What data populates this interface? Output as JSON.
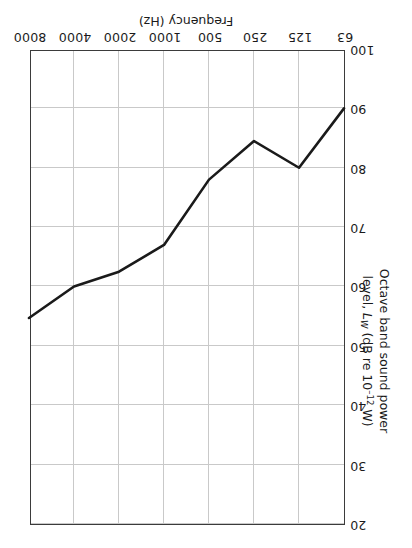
{
  "chart_data": {
    "type": "line",
    "title": "",
    "xlabel": "Frequency (Hz)",
    "ylabel_parts": {
      "line1": "Octave band sound power",
      "line2_pre": "level, ",
      "line2_sym": "L",
      "line2_sub": "W",
      "line2_mid": " (dB re 10",
      "line2_sup": "–12",
      "line2_post": " W)"
    },
    "ylabel": "Octave band sound power level, LW (dB re 10–12 W)",
    "categories": [
      "63",
      "125",
      "250",
      "500",
      "1000",
      "2000",
      "4000",
      "8000"
    ],
    "xtick_labels": [
      "63",
      "125",
      "250",
      "500",
      "1000",
      "2000",
      "4000",
      "8000"
    ],
    "ytick_labels": [
      "20",
      "30",
      "40",
      "50",
      "60",
      "70",
      "80",
      "90",
      "100"
    ],
    "values": [
      90.0,
      80.0,
      84.5,
      78.0,
      67.0,
      62.5,
      60.0,
      54.7
    ],
    "xlim_index": [
      0,
      7
    ],
    "ylim": [
      20,
      100
    ],
    "y_major_step": 10,
    "grid": true,
    "legend": null,
    "orientation_note": "figure printed rotated 180 degrees",
    "line_color": "#1a1a1a",
    "grid_color": "#c9c9c9",
    "axis_color": "#3b3b3b"
  }
}
